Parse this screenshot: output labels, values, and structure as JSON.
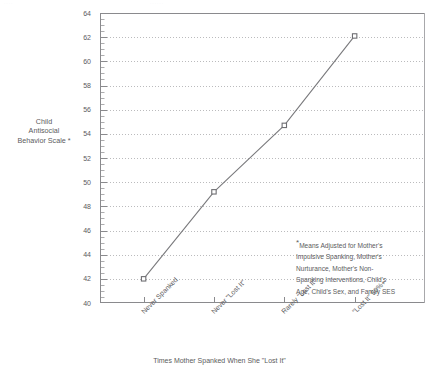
{
  "scan_artifacts": {
    "top_left": "····",
    "top_right": "······"
  },
  "chart_data": {
    "type": "line",
    "title": "",
    "xlabel": "Times Mother Spanked When She \"Lost It\"",
    "ylabel_lines": [
      "Child",
      "Antisocial",
      "Behavior Scale *"
    ],
    "ylabel": "Child Antisocial Behavior Scale *",
    "categories": [
      "Never Spanked",
      "Never \"Lost It\"",
      "Rarely \"Lost It\"",
      "\"Lost It\" 50%+"
    ],
    "values": [
      42.0,
      49.2,
      54.7,
      62.1
    ],
    "series": [
      {
        "name": "Child Antisocial Behavior Scale",
        "values": [
          42.0,
          49.2,
          54.7,
          62.1
        ]
      }
    ],
    "ylim": [
      40,
      64
    ],
    "ytick_step": 2,
    "yticks": [
      40,
      42,
      44,
      46,
      48,
      50,
      52,
      54,
      56,
      58,
      60,
      62,
      64
    ],
    "ytick_labels": [
      "40",
      "42",
      "44",
      "46",
      "48",
      "50",
      "52",
      "54",
      "56",
      "58",
      "60",
      "62",
      "64"
    ],
    "minor_tick_step": 0.5,
    "grid": {
      "horizontal": true,
      "vertical": false,
      "style": "dotted"
    },
    "legend": {
      "visible": false,
      "position": "none"
    },
    "marker": "open-square",
    "line_color": "#7a7a7d",
    "marker_color": "#6e6e72",
    "axis_color": "#8a8a8d",
    "grid_color": "#9a9a9d",
    "text_color": "#5b5b5d",
    "annotation": {
      "marker": "*",
      "lines": [
        "Means Adjusted for Mother's",
        "Impulsive Spanking, Mother's",
        "Nurturance, Mother's Non-",
        "Spanking Interventions, Child's",
        "Age, Child's Sex, and Family SES"
      ],
      "text": "*Means Adjusted for Mother's Impulsive Spanking, Mother's Nurturance, Mother's Non-Spanking Interventions, Child's Age, Child's Sex, and Family SES"
    }
  }
}
